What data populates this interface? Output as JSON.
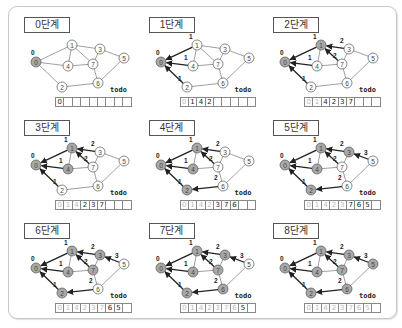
{
  "nodes": {
    "0": [
      28,
      56
    ],
    "1": [
      64,
      39
    ],
    "4": [
      60,
      60
    ],
    "2": [
      54,
      81
    ],
    "7": [
      85,
      58
    ],
    "3": [
      92,
      43
    ],
    "5": [
      116,
      52
    ],
    "6": [
      90,
      77
    ]
  },
  "edges": [
    [
      "0",
      "1"
    ],
    [
      "0",
      "4"
    ],
    [
      "0",
      "2"
    ],
    [
      "1",
      "4"
    ],
    [
      "1",
      "3"
    ],
    [
      "1",
      "7"
    ],
    [
      "4",
      "7"
    ],
    [
      "3",
      "7"
    ],
    [
      "3",
      "5"
    ],
    [
      "7",
      "6"
    ],
    [
      "2",
      "6"
    ],
    [
      "6",
      "5"
    ]
  ],
  "todo_label": "todo",
  "colors": {
    "visited": "#a8a8a8",
    "unvisited": "#ffffff",
    "stroke": "#555555",
    "arrow": "#222222",
    "faded_text": "#bbbbbb"
  },
  "stages": [
    {
      "title": "0단계",
      "visited": [
        "0"
      ],
      "dist": {
        "0": "0"
      },
      "tree": [],
      "todo": [
        "0"
      ],
      "faded": 0
    },
    {
      "title": "1단계",
      "visited": [
        "0"
      ],
      "dist": {
        "0": "0",
        "1": "1",
        "4": "1",
        "2": "1"
      },
      "tree": [
        [
          "1",
          "0"
        ],
        [
          "4",
          "0"
        ],
        [
          "2",
          "0"
        ]
      ],
      "todo": [
        "0",
        "1",
        "4",
        "2"
      ],
      "faded": 1
    },
    {
      "title": "2단계",
      "visited": [
        "0",
        "1"
      ],
      "dist": {
        "0": "0",
        "1": "1",
        "4": "1",
        "2": "1",
        "3": "2",
        "7": "2"
      },
      "tree": [
        [
          "1",
          "0"
        ],
        [
          "4",
          "0"
        ],
        [
          "2",
          "0"
        ],
        [
          "3",
          "1"
        ],
        [
          "7",
          "1"
        ]
      ],
      "todo": [
        "0",
        "1",
        "4",
        "2",
        "3",
        "7"
      ],
      "faded": 2
    },
    {
      "title": "3단계",
      "visited": [
        "0",
        "1",
        "4"
      ],
      "dist": {
        "0": "0",
        "1": "1",
        "4": "1",
        "2": "1",
        "3": "2",
        "7": "2"
      },
      "tree": [
        [
          "1",
          "0"
        ],
        [
          "4",
          "0"
        ],
        [
          "2",
          "0"
        ],
        [
          "3",
          "1"
        ],
        [
          "7",
          "1"
        ]
      ],
      "todo": [
        "0",
        "1",
        "4",
        "2",
        "3",
        "7"
      ],
      "faded": 3
    },
    {
      "title": "4단계",
      "visited": [
        "0",
        "1",
        "4",
        "2"
      ],
      "dist": {
        "0": "0",
        "1": "1",
        "4": "1",
        "2": "1",
        "3": "2",
        "7": "2",
        "6": "2"
      },
      "tree": [
        [
          "1",
          "0"
        ],
        [
          "4",
          "0"
        ],
        [
          "2",
          "0"
        ],
        [
          "3",
          "1"
        ],
        [
          "7",
          "1"
        ],
        [
          "6",
          "2"
        ]
      ],
      "todo": [
        "0",
        "1",
        "4",
        "2",
        "3",
        "7",
        "6"
      ],
      "faded": 4
    },
    {
      "title": "5단계",
      "visited": [
        "0",
        "1",
        "4",
        "2",
        "3"
      ],
      "dist": {
        "0": "0",
        "1": "1",
        "4": "1",
        "2": "1",
        "3": "2",
        "7": "2",
        "6": "2",
        "5": "3"
      },
      "tree": [
        [
          "1",
          "0"
        ],
        [
          "4",
          "0"
        ],
        [
          "2",
          "0"
        ],
        [
          "3",
          "1"
        ],
        [
          "7",
          "1"
        ],
        [
          "6",
          "2"
        ],
        [
          "5",
          "3"
        ]
      ],
      "todo": [
        "0",
        "1",
        "4",
        "2",
        "3",
        "7",
        "6",
        "5"
      ],
      "faded": 5
    },
    {
      "title": "6단계",
      "visited": [
        "0",
        "1",
        "4",
        "2",
        "3",
        "7"
      ],
      "dist": {
        "0": "0",
        "1": "1",
        "4": "1",
        "2": "1",
        "3": "2",
        "7": "2",
        "6": "2",
        "5": "3"
      },
      "tree": [
        [
          "1",
          "0"
        ],
        [
          "4",
          "0"
        ],
        [
          "2",
          "0"
        ],
        [
          "3",
          "1"
        ],
        [
          "7",
          "1"
        ],
        [
          "6",
          "2"
        ],
        [
          "5",
          "3"
        ]
      ],
      "todo": [
        "0",
        "1",
        "4",
        "2",
        "3",
        "7",
        "6",
        "5"
      ],
      "faded": 6
    },
    {
      "title": "7단계",
      "visited": [
        "0",
        "1",
        "4",
        "2",
        "3",
        "7",
        "6"
      ],
      "dist": {
        "0": "0",
        "1": "1",
        "4": "1",
        "2": "1",
        "3": "2",
        "7": "2",
        "6": "2",
        "5": "3"
      },
      "tree": [
        [
          "1",
          "0"
        ],
        [
          "4",
          "0"
        ],
        [
          "2",
          "0"
        ],
        [
          "3",
          "1"
        ],
        [
          "7",
          "1"
        ],
        [
          "6",
          "2"
        ],
        [
          "5",
          "3"
        ]
      ],
      "todo": [
        "0",
        "1",
        "4",
        "2",
        "3",
        "7",
        "6",
        "5"
      ],
      "faded": 7
    },
    {
      "title": "8단계",
      "visited": [
        "0",
        "1",
        "4",
        "2",
        "3",
        "7",
        "6",
        "5"
      ],
      "dist": {
        "0": "0",
        "1": "1",
        "4": "1",
        "2": "1",
        "3": "2",
        "7": "2",
        "6": "2",
        "5": "3"
      },
      "tree": [
        [
          "1",
          "0"
        ],
        [
          "4",
          "0"
        ],
        [
          "2",
          "0"
        ],
        [
          "3",
          "1"
        ],
        [
          "7",
          "1"
        ],
        [
          "6",
          "2"
        ],
        [
          "5",
          "3"
        ]
      ],
      "todo": [
        "0",
        "1",
        "4",
        "2",
        "3",
        "7",
        "6",
        "5"
      ],
      "faded": 8
    }
  ]
}
